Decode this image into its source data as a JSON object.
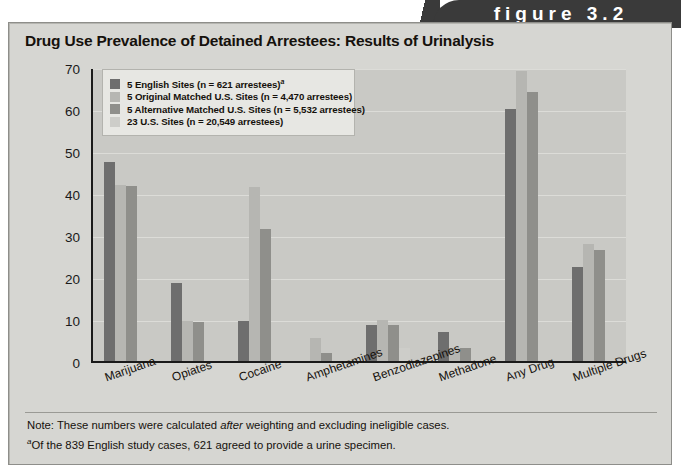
{
  "figure": {
    "banner_label": "figure 3.2"
  },
  "card": {
    "title": "Drug Use Prevalence of Detained Arrestees: Results of Urinalysis"
  },
  "notes": {
    "note_prefix": "Note: These numbers were calculated ",
    "note_italic": "after",
    "note_suffix": " weighting and excluding ineligible cases.",
    "footnote_marker": "a",
    "footnote_text": "Of the 839 English study cases, 621 agreed to provide a urine specimen."
  },
  "colors": {
    "series_1": "#6e6e6e",
    "series_2": "#b6b6b2",
    "series_3": "#8f8f8b",
    "series_4": "#cdcdc9",
    "plot_background": "#c9c9c5",
    "card_background": "#d6d6d2",
    "banner_background": "#3a3a3a",
    "axis": "#1a1a1a"
  },
  "chart_data": {
    "type": "bar",
    "title": "Drug Use Prevalence of Detained Arrestees: Results of Urinalysis",
    "xlabel": "",
    "ylabel": "Percentage Drug Positive",
    "ylim": [
      0,
      70
    ],
    "yticks": [
      0,
      10,
      20,
      30,
      40,
      50,
      60,
      70
    ],
    "grid": true,
    "legend_position": "top-left inside plot",
    "categories": [
      "Marijuana",
      "Opiates",
      "Cocaine",
      "Amphetamines",
      "Benzodiazepines",
      "Methadone",
      "Any Drug",
      "Multiple Drugs"
    ],
    "series": [
      {
        "name": "5 English Sites (n = 621 arrestees)",
        "legend_label_main": "5 English Sites (n = 621 arrestees)",
        "legend_superscript": "a",
        "color": "#6e6e6e",
        "values": [
          47.5,
          18.5,
          9.5,
          0,
          8.6,
          7.0,
          60.0,
          22.3
        ]
      },
      {
        "name": "5 Original Matched U.S. Sites (n = 4,470 arrestees)",
        "legend_label_main": "5 Original Matched U.S. Sites (n = 4,470 arrestees)",
        "legend_superscript": "",
        "color": "#b6b6b2",
        "values": [
          42.0,
          9.5,
          41.5,
          5.5,
          9.7,
          3.2,
          69.0,
          27.8
        ]
      },
      {
        "name": "5 Alternative Matched U.S. Sites (n = 5,532 arrestees)",
        "legend_label_main": "5 Alternative Matched U.S. Sites (n = 5,532 arrestees)",
        "legend_superscript": "",
        "color": "#8f8f8b",
        "values": [
          41.7,
          9.4,
          31.5,
          2.0,
          8.5,
          3.0,
          64.0,
          26.5
        ]
      },
      {
        "name": "23 U.S. Sites (n = 20,549 arrestees)",
        "legend_label_main": "23 U.S. Sites (n = 20,549 arrestees)",
        "legend_superscript": "",
        "color": "#cdcdc9",
        "values": [
          0,
          0,
          0,
          0,
          3.0,
          0,
          0,
          0
        ]
      }
    ]
  }
}
